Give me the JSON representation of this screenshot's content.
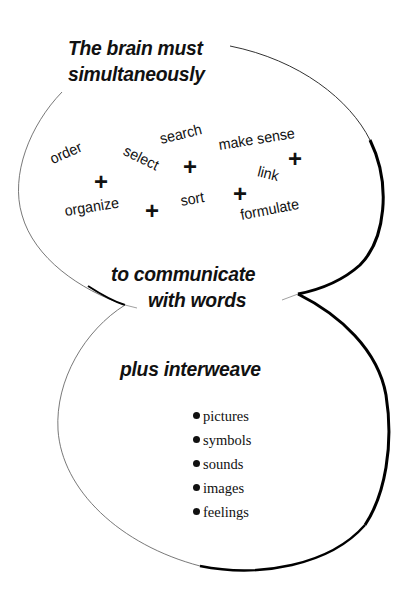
{
  "diagram": {
    "heading_top": [
      "The brain must",
      "simultaneously"
    ],
    "actions": {
      "order": "order",
      "select": "select",
      "search": "search",
      "make_sense": "make sense",
      "link": "link",
      "organize": "organize",
      "sort": "sort",
      "formulate": "formulate"
    },
    "plus_symbol": "+",
    "heading_middle": [
      "to communicate",
      "with words"
    ],
    "heading_bottom": "plus interweave",
    "list_items": [
      "pictures",
      "symbols",
      "sounds",
      "images",
      "feelings"
    ],
    "colors": {
      "ink": "#111111",
      "background": "#ffffff"
    }
  }
}
